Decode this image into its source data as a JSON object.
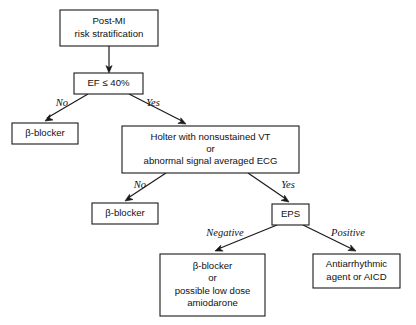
{
  "diagram": {
    "background_color": "#ffffff",
    "line_color": "#1a1a1a",
    "text_color": "#111111",
    "nodes": [
      {
        "id": "post-mi",
        "name": "post-mi-risk-stratification-node",
        "lines": [
          "Post-MI",
          "risk stratification"
        ],
        "x": 60,
        "y": 10,
        "w": 98,
        "h": 36
      },
      {
        "id": "ef",
        "name": "ef-decision-node",
        "lines": [
          "EF ≤ 40%"
        ],
        "x": 74,
        "y": 73,
        "w": 69,
        "h": 21
      },
      {
        "id": "beta-blocker-1",
        "name": "beta-blocker-node-left",
        "lines": [
          "β-blocker"
        ],
        "x": 12,
        "y": 123,
        "w": 66,
        "h": 21
      },
      {
        "id": "holter",
        "name": "holter-ecg-node",
        "lines": [
          "Holter with nonsustained VT",
          "or",
          "abnormal signal averaged ECG"
        ],
        "x": 122,
        "y": 126,
        "w": 177,
        "h": 47
      },
      {
        "id": "beta-blocker-2",
        "name": "beta-blocker-node-middle",
        "lines": [
          "β-blocker"
        ],
        "x": 92,
        "y": 203,
        "w": 66,
        "h": 21
      },
      {
        "id": "eps",
        "name": "eps-node",
        "lines": [
          "EPS"
        ],
        "x": 272,
        "y": 204,
        "w": 37,
        "h": 21
      },
      {
        "id": "beta-blocker-amiodarone",
        "name": "beta-blocker-amiodarone-node",
        "lines": [
          "β-blocker",
          "or",
          "possible low dose",
          "amiodarone"
        ],
        "x": 160,
        "y": 254,
        "w": 105,
        "h": 62
      },
      {
        "id": "antiarrhythmic",
        "name": "antiarrhythmic-aicd-node",
        "lines": [
          "Antiarrhythmic",
          "agent or AICD"
        ],
        "x": 313,
        "y": 254,
        "w": 87,
        "h": 34
      }
    ],
    "edges": [
      {
        "id": "e-postmi-ef",
        "name": "edge-post-mi-to-ef",
        "from": "post-mi",
        "to": "ef",
        "path": "M 109 46 L 109 68",
        "arrow": {
          "x": 109,
          "y": 73,
          "angle": 90
        }
      },
      {
        "id": "e-ef-no",
        "name": "edge-ef-no-to-beta-blocker",
        "from": "ef",
        "to": "beta-blocker-1",
        "path": "M 88 94 L 47 118",
        "arrow": {
          "x": 45,
          "y": 121,
          "angle": 150
        }
      },
      {
        "id": "e-ef-yes",
        "name": "edge-ef-yes-to-holter",
        "from": "ef",
        "to": "holter",
        "path": "M 129 94 L 182 121",
        "arrow": {
          "x": 186,
          "y": 124,
          "angle": 27
        }
      },
      {
        "id": "e-holter-no",
        "name": "edge-holter-no-to-beta-blocker",
        "from": "holter",
        "to": "beta-blocker-2",
        "path": "M 166 173 L 128 198",
        "arrow": {
          "x": 125,
          "y": 201,
          "angle": 147
        }
      },
      {
        "id": "e-holter-yes",
        "name": "edge-holter-yes-to-eps",
        "from": "holter",
        "to": "eps",
        "path": "M 248 173 L 286 199",
        "arrow": {
          "x": 289,
          "y": 202,
          "angle": 34
        }
      },
      {
        "id": "e-eps-negative",
        "name": "edge-eps-negative-to-beta-blocker-amiodarone",
        "from": "eps",
        "to": "beta-blocker-amiodarone",
        "path": "M 277 225 L 218 249",
        "arrow": {
          "x": 215,
          "y": 251,
          "angle": 158
        }
      },
      {
        "id": "e-eps-positive",
        "name": "edge-eps-positive-to-antiarrhythmic",
        "from": "eps",
        "to": "antiarrhythmic",
        "path": "M 303 225 L 352 249",
        "arrow": {
          "x": 356,
          "y": 251,
          "angle": 26
        }
      }
    ],
    "edge_labels": [
      {
        "id": "l-no-1",
        "name": "edge-label-no-ef",
        "text": "No",
        "x": 62,
        "y": 104
      },
      {
        "id": "l-yes-1",
        "name": "edge-label-yes-ef",
        "text": "Yes",
        "x": 153,
        "y": 104
      },
      {
        "id": "l-no-2",
        "name": "edge-label-no-holter",
        "text": "No",
        "x": 140,
        "y": 186
      },
      {
        "id": "l-yes-2",
        "name": "edge-label-yes-holter",
        "text": "Yes",
        "x": 288,
        "y": 186
      },
      {
        "id": "l-negative",
        "name": "edge-label-negative-eps",
        "text": "Negative",
        "x": 225,
        "y": 234
      },
      {
        "id": "l-positive",
        "name": "edge-label-positive-eps",
        "text": "Positive",
        "x": 348,
        "y": 234
      }
    ]
  }
}
